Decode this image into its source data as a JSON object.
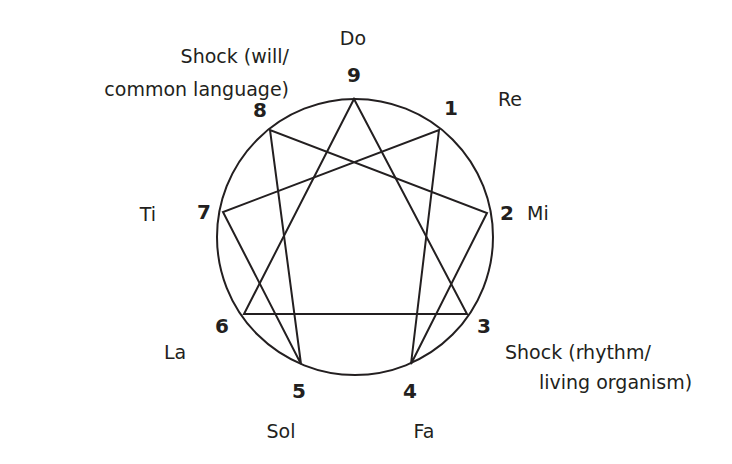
{
  "diagram": {
    "type": "enneagram",
    "stroke_color": "#231f20",
    "text_color": "#231f20",
    "circle": {
      "cx": 355,
      "cy": 237,
      "r": 138
    },
    "points": [
      {
        "number": "9",
        "note": "Do",
        "x": 354,
        "y": 99
      },
      {
        "number": "1",
        "note": "Re",
        "x": 439,
        "y": 130
      },
      {
        "number": "2",
        "note": "Mi",
        "x": 487,
        "y": 213
      },
      {
        "number": "3",
        "note": "",
        "x": 467,
        "y": 314
      },
      {
        "number": "4",
        "note": "Fa",
        "x": 411,
        "y": 364
      },
      {
        "number": "5",
        "note": "Sol",
        "x": 301,
        "y": 364
      },
      {
        "number": "6",
        "note": "La",
        "x": 244,
        "y": 314
      },
      {
        "number": "7",
        "note": "Ti",
        "x": 223,
        "y": 212
      },
      {
        "number": "8",
        "note": "",
        "x": 270,
        "y": 130
      }
    ],
    "triangle": [
      "9",
      "3",
      "6"
    ],
    "hexad": [
      "1",
      "4",
      "2",
      "8",
      "5",
      "7"
    ],
    "labels": {
      "n9": "9",
      "n1": "1",
      "n2": "2",
      "n3": "3",
      "n4": "4",
      "n5": "5",
      "n6": "6",
      "n7": "7",
      "n8": "8",
      "do": "Do",
      "re": "Re",
      "mi": "Mi",
      "fa": "Fa",
      "sol": "Sol",
      "la": "La",
      "ti": "Ti",
      "shock_will_line1": "Shock (will/",
      "shock_will_line2": "common language)",
      "shock_rhythm_line1": "Shock (rhythm/",
      "shock_rhythm_line2": "living organism)"
    }
  }
}
